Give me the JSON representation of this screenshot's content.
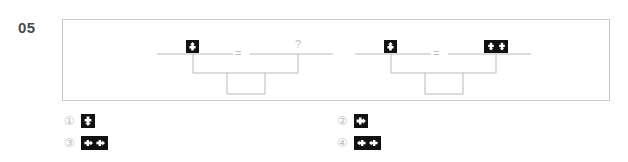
{
  "question": {
    "number": "05",
    "type": "balance-scale-analogy"
  },
  "stimulus": {
    "scales": [
      {
        "id": "scale-1",
        "left_pan": {
          "icon": "tile-arrow-up-single",
          "glyph": "arrow-up",
          "count": 1
        },
        "operator": "=",
        "right_pan": {
          "icon": "question-mark",
          "glyph": "?",
          "count": 0
        },
        "operator_label": "=",
        "unknown_label": "?"
      },
      {
        "id": "scale-2",
        "left_pan": {
          "icon": "tile-arrow-up-single",
          "glyph": "arrow-up",
          "count": 1
        },
        "operator": "=",
        "right_pan": {
          "icon": "tile-arrow-down-double",
          "glyph": "arrow-down",
          "count": 2
        },
        "operator_label": "=",
        "unknown_label": ""
      }
    ]
  },
  "options": [
    {
      "marker": "①",
      "number": "1",
      "icon": "tile-arrow-down-single",
      "glyph": "arrow-down",
      "count": 1
    },
    {
      "marker": "②",
      "number": "2",
      "icon": "tile-arrow-right-single",
      "glyph": "arrow-right",
      "count": 1
    },
    {
      "marker": "③",
      "number": "3",
      "icon": "tile-arrow-right-double",
      "glyph": "arrow-right",
      "count": 2
    },
    {
      "marker": "④",
      "number": "4",
      "icon": "tile-arrow-left-double",
      "glyph": "arrow-left",
      "count": 2
    }
  ],
  "colors": {
    "frame_border": "#c9c9c9",
    "scale_line": "#b9b9b9",
    "tile_background": "#111111",
    "tile_glyph": "#ffffff",
    "number_text": "#4a4a4a",
    "option_marker": "#bdbdbd",
    "operator_text": "#bdbdbd"
  }
}
